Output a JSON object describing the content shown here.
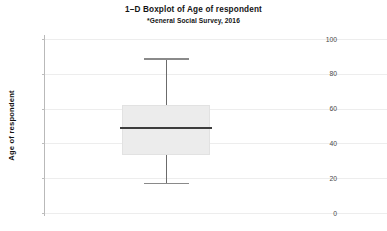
{
  "chart_data": {
    "type": "box",
    "title": "1–D Boxplot of Age of respondent",
    "subtitle": "*General Social Survey, 2016",
    "xlabel": "",
    "ylabel": "Age of respondent",
    "ylim": [
      0,
      105
    ],
    "yticks": [
      0,
      20,
      40,
      60,
      80,
      100
    ],
    "ytick_labels": [
      "0",
      "20",
      "40",
      "60",
      "80",
      "100"
    ],
    "grid": "horizontal",
    "legend": "none",
    "orientation": "vertical",
    "boxes": [
      {
        "name": "Age of respondent",
        "whisker_low": 17.5,
        "q1": 33.5,
        "median": 49.0,
        "q3": 62.0,
        "whisker_high": 89.0,
        "outliers": [],
        "box_fill": "#ececec",
        "median_color": "#3c3c3c",
        "whisker_color": "#6b6b6b"
      }
    ]
  },
  "figure": {
    "background": "#ffffff",
    "grid_color": "#ededed",
    "axis_color": "#b9b9b9",
    "text_color": "#141414",
    "tick_text_color": "#4a4a4a"
  }
}
